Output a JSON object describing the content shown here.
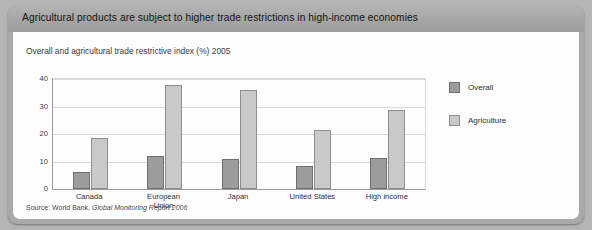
{
  "header": {
    "title": "Agricultural products are subject to higher trade restrictions in high-income economies"
  },
  "subtitle": "Overall and agricultural trade restrictive index (%) 2005",
  "source": {
    "prefix": "Source: World Bank, ",
    "italic": "Global Monitoring Report 2006"
  },
  "legend": {
    "position": "right",
    "items": [
      {
        "label": "Overall",
        "color": "#9c9c9c",
        "icon": "square-swatch-icon"
      },
      {
        "label": "Agriculture",
        "color": "#c9c9c9",
        "icon": "square-swatch-icon"
      }
    ]
  },
  "chart_data": {
    "type": "bar",
    "title": "Overall and agricultural trade restrictive index (%) 2005",
    "xlabel": "",
    "ylabel": "",
    "ylim": [
      0,
      40
    ],
    "yticks": [
      0,
      10,
      20,
      30,
      40
    ],
    "grid": true,
    "categories": [
      "Canada",
      "European Union",
      "Japan",
      "United States",
      "High income"
    ],
    "category_lines": [
      [
        "Canada"
      ],
      [
        "European",
        "Union"
      ],
      [
        "Japan"
      ],
      [
        "United States"
      ],
      [
        "High income"
      ]
    ],
    "series": [
      {
        "name": "Overall",
        "color": "#9c9c9c",
        "values": [
          6.2,
          12.0,
          11.0,
          8.2,
          11.2
        ]
      },
      {
        "name": "Agriculture",
        "color": "#c9c9c9",
        "values": [
          18.7,
          38.0,
          36.0,
          21.5,
          28.7
        ]
      }
    ]
  }
}
